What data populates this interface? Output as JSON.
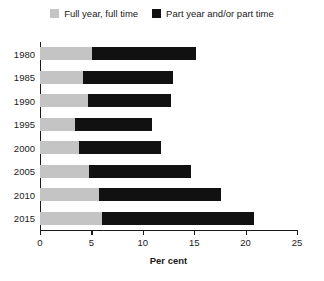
{
  "legend": {
    "position": "top-center",
    "items": [
      {
        "label": "Full year, full time",
        "color": "#c4c4c4",
        "swatch_name": "legend-swatch-full-year-full-time"
      },
      {
        "label": "Part year and/or part time",
        "color": "#111111",
        "swatch_name": "legend-swatch-part-year-part-time"
      }
    ]
  },
  "axes": {
    "x_title": "Per cent",
    "x_ticks": [
      "0",
      "5",
      "10",
      "15",
      "20",
      "25"
    ],
    "y_ticks": [
      "1980",
      "1985",
      "1990",
      "1995",
      "2000",
      "2005",
      "2010",
      "2015"
    ]
  },
  "chart_data": {
    "type": "bar",
    "orientation": "horizontal",
    "stacked": true,
    "title": "",
    "subtitle": "",
    "xlabel": "Per cent",
    "ylabel": "",
    "xlim": [
      0,
      25
    ],
    "xticks": [
      0,
      5,
      10,
      15,
      20,
      25
    ],
    "grid": false,
    "legend_position": "top-center",
    "categories": [
      "1980",
      "1985",
      "1990",
      "1995",
      "2000",
      "2005",
      "2010",
      "2015"
    ],
    "series": [
      {
        "name": "Full year, full time",
        "color": "#c4c4c4",
        "values": [
          5.1,
          4.2,
          4.7,
          3.4,
          3.8,
          4.8,
          5.7,
          6.0
        ]
      },
      {
        "name": "Part year and/or part time",
        "color": "#111111",
        "values": [
          10.1,
          8.7,
          8.0,
          7.5,
          8.0,
          9.9,
          11.9,
          14.8
        ]
      }
    ],
    "totals": [
      15.2,
      12.9,
      12.7,
      10.9,
      11.8,
      14.7,
      17.6,
      20.8
    ]
  }
}
